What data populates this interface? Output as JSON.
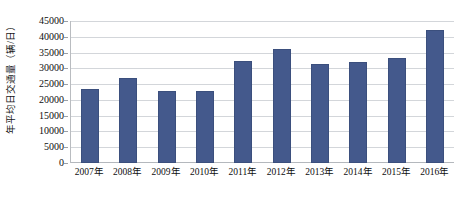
{
  "chart_data": {
    "type": "bar",
    "title": "",
    "xlabel": "",
    "ylabel": "年平均日交通量（辆/日）",
    "categories": [
      "2007年",
      "2008年",
      "2009年",
      "2010年",
      "2011年",
      "2012年",
      "2013年",
      "2014年",
      "2015年",
      "2016年"
    ],
    "values": [
      23500,
      27000,
      22800,
      22800,
      32300,
      36000,
      31300,
      32000,
      33300,
      42000
    ],
    "ylim": [
      0,
      45000
    ],
    "y_ticks": [
      0,
      5000,
      10000,
      15000,
      20000,
      25000,
      30000,
      35000,
      40000,
      45000
    ],
    "y_tick_labels": [
      "0",
      "5000",
      "10000",
      "15000",
      "20000",
      "25000",
      "30000",
      "35000",
      "40000",
      "45000"
    ],
    "grid": true,
    "legend": false,
    "legend_position": "none",
    "series": [
      {
        "name": "年平均日交通量",
        "color": "#44598c",
        "values": [
          23500,
          27000,
          22800,
          22800,
          32300,
          36000,
          31300,
          32000,
          33300,
          42000
        ]
      }
    ]
  },
  "colors": {
    "bar": "#44598c",
    "bar_border": "#3b4f7d",
    "gridline": "#d3d6da",
    "axis": "#b4b8bd",
    "background": "#ffffff",
    "text": "#0e0e0e"
  }
}
